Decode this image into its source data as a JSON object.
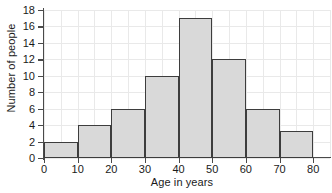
{
  "chart_data": {
    "type": "bar",
    "title": "",
    "xlabel": "Age in years",
    "ylabel": "Number of people",
    "categories": [
      "0-10",
      "10-20",
      "20-30",
      "30-40",
      "40-50",
      "50-60",
      "60-70",
      "70-80"
    ],
    "bin_edges": [
      0,
      10,
      20,
      30,
      40,
      50,
      60,
      70,
      80
    ],
    "values": [
      2,
      4,
      6,
      10,
      17,
      12,
      6,
      3.3
    ],
    "bin_width": 10,
    "xlim": [
      0,
      85
    ],
    "ylim": [
      0,
      18
    ],
    "xticks": [
      0,
      10,
      20,
      30,
      40,
      50,
      60,
      70,
      80
    ],
    "yticks": [
      0,
      2,
      4,
      6,
      8,
      10,
      12,
      14,
      16,
      18
    ],
    "xtick_labels": [
      "0",
      "10",
      "20",
      "30",
      "40",
      "50",
      "60",
      "70",
      "80"
    ],
    "ytick_labels": [
      "0",
      "2",
      "4",
      "6",
      "8",
      "10",
      "12",
      "14",
      "16",
      "18"
    ],
    "grid": true,
    "grid_color": "#e9e9e9",
    "legend": null,
    "bar_fill_color": "#d9d9d9",
    "bar_edge_color": "#3d3d3d",
    "axis_color": "#4a4a4a",
    "background_color": "#ffffff"
  }
}
